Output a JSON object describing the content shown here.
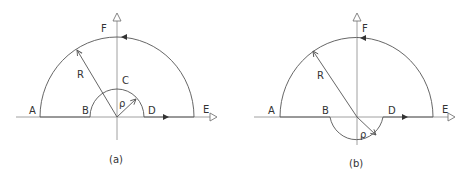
{
  "figure": {
    "panels": [
      {
        "id": "a",
        "caption": "(a)",
        "labels": {
          "A": "A",
          "B": "B",
          "C": "C",
          "D": "D",
          "E": "E",
          "F": "F",
          "R": "R",
          "rho": "ρ"
        },
        "small_arc_position": "above real axis"
      },
      {
        "id": "b",
        "caption": "(b)",
        "labels": {
          "A": "A",
          "B": "B",
          "D": "D",
          "E": "E",
          "F": "F",
          "R": "R",
          "rho": "ρ"
        },
        "small_arc_position": "below real axis"
      }
    ],
    "colors": {
      "line": "#555555",
      "axis": "#888888",
      "text": "#333333"
    }
  }
}
